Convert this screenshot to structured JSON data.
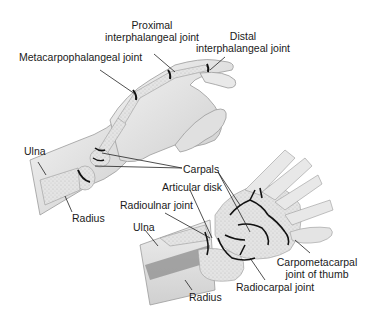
{
  "upper_illustration": {
    "labels": {
      "proximal_ip_line1": "Proximal",
      "proximal_ip_line2": "interphalangeal joint",
      "distal_ip_line1": "Distal",
      "distal_ip_line2": "interphalangeal joint",
      "metacarpophalangeal": "Metacarpophalangeal joint",
      "ulna": "Ulna",
      "radius": "Radius",
      "carpals": "Carpals"
    }
  },
  "lower_illustration": {
    "labels": {
      "articular_disk": "Articular disk",
      "radioulnar_joint": "Radioulnar joint",
      "ulna": "Ulna",
      "radius": "Radius",
      "radiocarpal_joint": "Radiocarpal joint",
      "cmc_thumb_line1": "Carpometacarpal",
      "cmc_thumb_line2": "joint of thumb"
    }
  },
  "colors": {
    "skin": "#e6e6e6",
    "bone": "#d9d9d9",
    "joint_line": "#111111",
    "leader_line": "#222222"
  }
}
